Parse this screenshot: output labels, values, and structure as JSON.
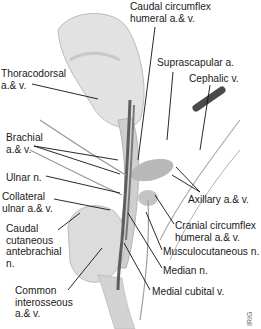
{
  "figure": {
    "credit": "IRIG",
    "colors": {
      "vessel": "#5a5a5a",
      "bone": "#d4d4d4",
      "muscle": "#bdbdbd",
      "line": "#111111"
    }
  },
  "labels": [
    {
      "id": "caudal-circumflex",
      "text": "Caudal circumflex\nhumeral a.& v.",
      "x": 130,
      "y": 1
    },
    {
      "id": "suprascapular",
      "text": "Suprascapular a.",
      "x": 157,
      "y": 57
    },
    {
      "id": "cephalic",
      "text": "Cephalic v.",
      "x": 189,
      "y": 73
    },
    {
      "id": "thoracodorsal",
      "text": "Thoracodorsal\na.& v.",
      "x": 1,
      "y": 68
    },
    {
      "id": "brachial",
      "text": "Brachial\na.& v.",
      "x": 6,
      "y": 132
    },
    {
      "id": "ulnar-n",
      "text": "Ulnar n.",
      "x": 6,
      "y": 172
    },
    {
      "id": "collateral-ulnar",
      "text": "Collateral\nulnar a.& v.",
      "x": 2,
      "y": 191
    },
    {
      "id": "caudal-cutaneous",
      "text": "Caudal\ncutaneous\nantebrachial\nn.",
      "x": 6,
      "y": 223
    },
    {
      "id": "common-interosseous",
      "text": "Common\ninterosseous\na.& v.",
      "x": 15,
      "y": 285
    },
    {
      "id": "axillary",
      "text": "Axillary a.& v.",
      "x": 188,
      "y": 194
    },
    {
      "id": "cranial-circumflex",
      "text": "Cranial circumflex\nhumeral a.& v.",
      "x": 175,
      "y": 220
    },
    {
      "id": "musculocutaneous",
      "text": "Musculocutaneous n.",
      "x": 163,
      "y": 246
    },
    {
      "id": "median",
      "text": "Median n.",
      "x": 163,
      "y": 265
    },
    {
      "id": "medial-cubital",
      "text": "Medial cubital v.",
      "x": 152,
      "y": 286
    }
  ]
}
